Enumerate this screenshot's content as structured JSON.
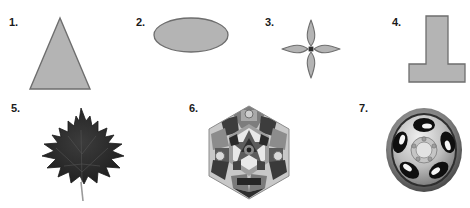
{
  "figure": {
    "width": 470,
    "height": 208,
    "background_color": "#ffffff"
  },
  "style": {
    "geometric_fill": "#b4b4b4",
    "geometric_stroke": "#6e6e6e",
    "label_color": "#1a1a1a",
    "leaf_dark": "#262626",
    "leaf_mid": "#3a3a3a",
    "leaf_stem": "#9a9a9a",
    "kaleido_light": "#cfcfcf",
    "kaleido_mid": "#8e8e8e",
    "kaleido_dark": "#4a4a4a",
    "kaleido_darkest": "#2b2b2b",
    "wheel_rim_light": "#d8d8d8",
    "wheel_rim_mid": "#9e9e9e",
    "wheel_shadow": "#5a5a5a",
    "wheel_hole": "#141414",
    "wheel_highlight": "#f2f2f2"
  },
  "items": [
    {
      "number": "1.",
      "name": "triangle",
      "icon": "triangle-shape",
      "row": 1
    },
    {
      "number": "2.",
      "name": "ellipse",
      "icon": "ellipse-shape",
      "row": 1
    },
    {
      "number": "3.",
      "name": "four-pointed-star",
      "icon": "four-pointed-star-shape",
      "row": 1
    },
    {
      "number": "4.",
      "name": "tee-shape",
      "icon": "tee-shape",
      "row": 1
    },
    {
      "number": "5.",
      "name": "maple-leaf",
      "icon": "maple-leaf-photo",
      "row": 2
    },
    {
      "number": "6.",
      "name": "kaleidoscope-hexagon",
      "icon": "kaleidoscope-photo",
      "row": 2
    },
    {
      "number": "7.",
      "name": "alloy-wheel",
      "icon": "alloy-wheel-photo",
      "row": 2
    }
  ]
}
